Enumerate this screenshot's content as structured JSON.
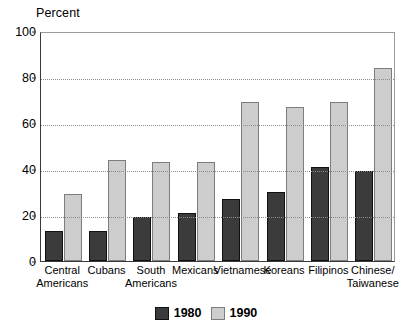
{
  "chart_data": {
    "type": "bar",
    "title": "",
    "ylabel": "Percent",
    "xlabel": "",
    "ylim": [
      0,
      100
    ],
    "yticks": [
      0,
      20,
      40,
      60,
      80,
      100
    ],
    "grid": true,
    "legend_position": "bottom-center",
    "categories": [
      "Central\nAmericans",
      "Cubans",
      "South\nAmericans",
      "Mexicans",
      "Vietnamese",
      "Koreans",
      "Filipinos",
      "Chinese/\nTaiwanese"
    ],
    "series": [
      {
        "name": "1980",
        "color": "#3b3b3b",
        "values": [
          13,
          13,
          19,
          21,
          27,
          30,
          41,
          39
        ]
      },
      {
        "name": "1990",
        "color": "#cdcdcd",
        "values": [
          29,
          44,
          43,
          43,
          69,
          67,
          69,
          84
        ]
      }
    ]
  },
  "legend": {
    "items": [
      {
        "label": "1980"
      },
      {
        "label": "1990"
      }
    ]
  }
}
